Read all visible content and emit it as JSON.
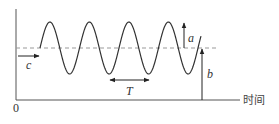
{
  "diagram": {
    "type": "sinusoidal-wave-parameters",
    "colors": {
      "stroke": "#333333",
      "dashed": "#999999",
      "text": "#333333",
      "background": "#ffffff"
    },
    "axes": {
      "origin_label": "0",
      "x_label": "时间"
    },
    "labels": {
      "amplitude": "a",
      "baseline": "b",
      "phase_shift": "c",
      "period": "T"
    },
    "wave": {
      "start_x": 40,
      "end_x": 201,
      "center_y": 48,
      "amplitude_px": 26,
      "period_px": 39.5,
      "cycles": 4
    }
  }
}
